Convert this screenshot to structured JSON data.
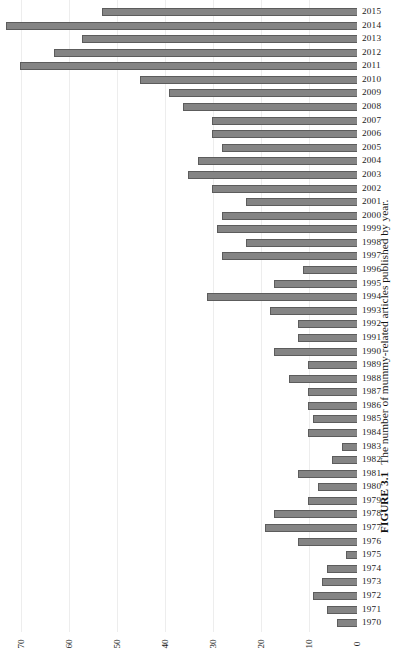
{
  "caption": {
    "number": "FIGURE 3.1",
    "text": "The number of mummy-related articles published by year."
  },
  "chart_data": {
    "type": "bar",
    "orientation": "horizontal",
    "title": "",
    "xlabel": "",
    "ylabel": "",
    "xlim": [
      0,
      73
    ],
    "xticks": [
      0,
      10,
      20,
      30,
      40,
      50,
      60,
      70
    ],
    "xtick_labels": [
      "0",
      "10",
      "20",
      "30",
      "40",
      "50",
      "60",
      "70"
    ],
    "grid": "vertical-only",
    "legend": "none",
    "bar_color": "#848484",
    "bar_edge_color": "#5c5c5c",
    "gridline_color": "#ededed",
    "categories": [
      "2015",
      "2014",
      "2013",
      "2012",
      "2011",
      "2010",
      "2009",
      "2008",
      "2007",
      "2006",
      "2005",
      "2004",
      "2003",
      "2002",
      "2001",
      "2000",
      "1999",
      "1998",
      "1997",
      "1996",
      "1995",
      "1994",
      "1993",
      "1992",
      "1991",
      "1990",
      "1989",
      "1988",
      "1987",
      "1986",
      "1985",
      "1984",
      "1983",
      "1982",
      "1981",
      "1980",
      "1979",
      "1978",
      "1977",
      "1976",
      "1975",
      "1974",
      "1973",
      "1972",
      "1971",
      "1970"
    ],
    "values": [
      53,
      73,
      57,
      63,
      70,
      45,
      39,
      36,
      30,
      30,
      28,
      33,
      35,
      30,
      23,
      28,
      29,
      23,
      28,
      11,
      17,
      31,
      18,
      12,
      12,
      17,
      10,
      14,
      10,
      10,
      9,
      10,
      3,
      5,
      12,
      8,
      10,
      17,
      19,
      12,
      2,
      6,
      7,
      9,
      6,
      4
    ]
  }
}
